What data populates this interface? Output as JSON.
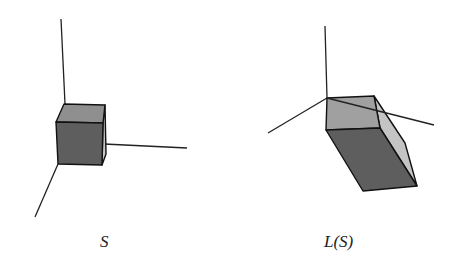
{
  "figures": [
    {
      "id": "original",
      "label": "S",
      "description": "Unit cube at origin of 3D coordinate axes",
      "colors": {
        "front": "#5e5e5e",
        "top": "#8f8f8f",
        "side": "#c8c8c8"
      }
    },
    {
      "id": "transformed",
      "label": "L(S)",
      "description": "Image of the cube under linear transformation L (sheared parallelepiped)",
      "colors": {
        "front": "#5e5e5e",
        "top": "#a0a0a0",
        "side": "#c4c4c4"
      }
    }
  ]
}
